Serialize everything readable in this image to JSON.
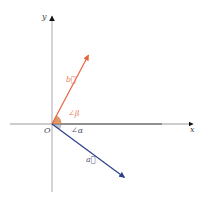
{
  "diagram": {
    "type": "vector-angle-diagram",
    "axes": {
      "x_label": "x",
      "y_label": "y",
      "origin_label": "O",
      "axis_color": "#b8b8b8",
      "x_axis_dark_segment_color": "#222222"
    },
    "vectors": [
      {
        "name": "b",
        "label": "b⃗",
        "color": "#e8623e",
        "from": [
          52,
          124
        ],
        "to": [
          89,
          54
        ]
      },
      {
        "name": "a",
        "label": "a⃗",
        "color": "#2e3f8a",
        "from": [
          52,
          124
        ],
        "to": [
          125,
          178
        ]
      }
    ],
    "angles": [
      {
        "name": "beta",
        "label": "∠β",
        "color": "#e8825e"
      },
      {
        "name": "alpha",
        "label": "∠α",
        "color": "#555a7a"
      }
    ],
    "angle_marker_color": "#d9854f"
  }
}
